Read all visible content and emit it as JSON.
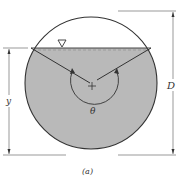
{
  "diagram": {
    "caption": "(a)",
    "labels": {
      "depth": "y",
      "diameter": "D",
      "angle": "θ",
      "center": "+"
    },
    "symbols": {
      "free_surface": "water-surface-triangle"
    },
    "colors": {
      "water": "#b9b9b9",
      "outline": "#333333",
      "background": "#ffffff"
    }
  }
}
